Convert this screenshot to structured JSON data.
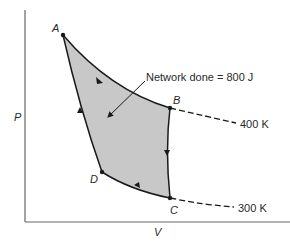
{
  "diagram": {
    "type": "PV cycle diagram",
    "axes": {
      "x_label": "V",
      "y_label": "P"
    },
    "points": [
      {
        "id": "A",
        "label": "A"
      },
      {
        "id": "B",
        "label": "B"
      },
      {
        "id": "C",
        "label": "C"
      },
      {
        "id": "D",
        "label": "D"
      }
    ],
    "isotherms": [
      {
        "label": "400 K",
        "through": "B"
      },
      {
        "label": "300 K",
        "through": "C"
      }
    ],
    "annotation": {
      "text": "Network done = 800 J",
      "points_to": "shaded-region"
    },
    "colors": {
      "fill": "#c8c8c8",
      "stroke": "#1a1a1a",
      "axis": "#555555"
    }
  }
}
